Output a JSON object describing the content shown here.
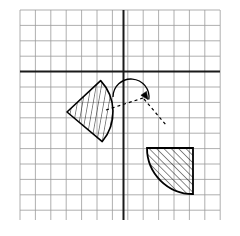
{
  "figure": {
    "canvas": {
      "width": 240,
      "height": 236,
      "background": "#ffffff"
    }
  },
  "chart_data": {
    "type": "diagram",
    "title": "",
    "xlabel": "",
    "ylabel": "",
    "grid": {
      "visible": true,
      "columns": 13,
      "rows": 13,
      "cell_size": 15.4,
      "origin_px": {
        "x": 123.5,
        "y": 71.5
      },
      "bounds_px": {
        "left": 20,
        "top": 10,
        "right": 220,
        "bottom": 220
      },
      "minor_color": "#9a9a9a",
      "minor_width": 0.8
    },
    "axes": {
      "visible": true,
      "color": "#1a1a1a",
      "width": 2.0,
      "x_axis_y_px": 71.5,
      "y_axis_x_px": 123.5,
      "xlim": [
        -7,
        6
      ],
      "ylim": [
        -9,
        4
      ]
    },
    "shapes": [
      {
        "name": "pre-image-sector",
        "role": "pre-image",
        "type": "circular-sector",
        "apex_px": {
          "x": 67.0,
          "y": 112.0
        },
        "radius_px": 46.0,
        "start_angle_deg": -43,
        "end_angle_deg": 40,
        "fill": "none",
        "stroke": "#000000",
        "stroke_width": 1.6,
        "hatch": {
          "angle_deg": 10,
          "spacing_px": 5.2,
          "color": "#000000",
          "width": 0.9
        }
      },
      {
        "name": "image-quadrant",
        "role": "image",
        "type": "quarter-circle",
        "corner_px": {
          "x": 193.0,
          "y": 148.0
        },
        "radius_px": 46.0,
        "start_angle_deg": 90,
        "end_angle_deg": 180,
        "fill": "none",
        "stroke": "#000000",
        "stroke_width": 1.8,
        "hatch": {
          "angle_deg": -45,
          "spacing_px": 5.2,
          "color": "#000000",
          "width": 0.9
        }
      }
    ],
    "annotations": [
      {
        "name": "rotation-arc-arrow",
        "type": "curved-arrow",
        "center_px": {
          "x": 131.0,
          "y": 97.0
        },
        "radius_px": 18.0,
        "start_angle_deg": 180,
        "end_angle_deg": 8,
        "direction": "clockwise",
        "stroke": "#000000",
        "stroke_width": 1.3,
        "arrowhead_px": {
          "x": 148.0,
          "y": 99.5
        },
        "arrowhead_angle_deg": 55
      },
      {
        "name": "correspondence-dashed-left",
        "type": "dashed-line",
        "from_px": {
          "x": 106.0,
          "y": 110.0
        },
        "to_px": {
          "x": 143.0,
          "y": 98.0
        },
        "dash": "3,3",
        "stroke": "#000000",
        "stroke_width": 1.2
      },
      {
        "name": "correspondence-dashed-right",
        "type": "dashed-line",
        "from_px": {
          "x": 144.0,
          "y": 99.0
        },
        "to_px": {
          "x": 166.0,
          "y": 125.0
        },
        "dash": "3,3",
        "stroke": "#000000",
        "stroke_width": 1.2
      }
    ]
  }
}
